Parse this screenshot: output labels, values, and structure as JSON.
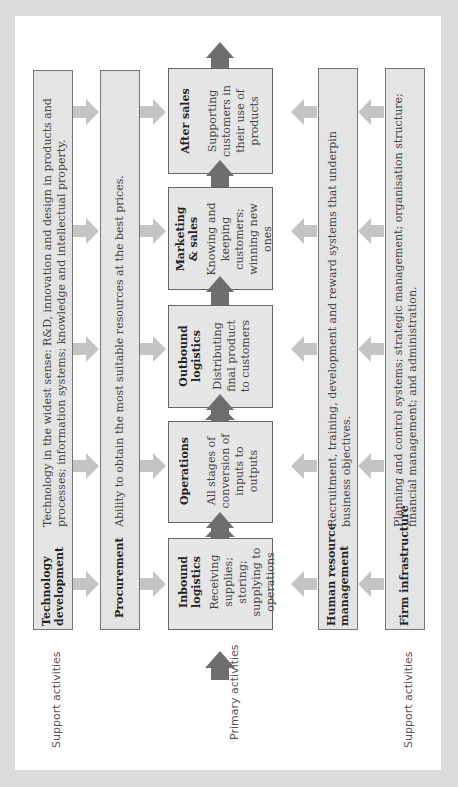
{
  "diagram": {
    "side_labels": {
      "support_top": "Support activities",
      "primary": "Primary activities",
      "support_bottom": "Support activities"
    },
    "support_activities": [
      {
        "name": "Technology development",
        "title_lines": [
          "Technology",
          "development"
        ],
        "description_lines": [
          "Technology in the widest sense: R&D, innovation and design in products and",
          "processes; information systems; knowledge and intellectual property."
        ]
      },
      {
        "name": "Procurement",
        "title_lines": [
          "Procurement"
        ],
        "description_lines": [
          "Ability to obtain the most suitable resources at the best prices."
        ]
      },
      {
        "name": "Human resource management",
        "title_lines": [
          "Human resource",
          "management"
        ],
        "description_lines": [
          "Recruitment, training, development and reward systems that underpin",
          "business objectives."
        ]
      },
      {
        "name": "Firm infrastructure",
        "title_lines": [
          "Firm infrastructure"
        ],
        "description_lines": [
          "Planning and control systems; strategic management; organisation structure;",
          "financial management; and administration."
        ]
      }
    ],
    "primary_activities": [
      {
        "name": "Inbound logistics",
        "title_lines": [
          "Inbound",
          "logistics"
        ],
        "description_lines": [
          "Receiving",
          "supplies;",
          "storing;",
          "supplying to",
          "operations"
        ]
      },
      {
        "name": "Operations",
        "title_lines": [
          "Operations"
        ],
        "description_lines": [
          "All stages of",
          "conversion of",
          "inputs to",
          "outputs"
        ]
      },
      {
        "name": "Outbound logistics",
        "title_lines": [
          "Outbound",
          "logistics"
        ],
        "description_lines": [
          "Distributing",
          "final product",
          "to customers"
        ]
      },
      {
        "name": "Marketing & sales",
        "title_lines": [
          "Marketing",
          "& sales"
        ],
        "description_lines": [
          "Knowing and",
          "keeping",
          "customers;",
          "winning new",
          "ones"
        ]
      },
      {
        "name": "After sales",
        "title_lines": [
          "After sales"
        ],
        "description_lines": [
          "Supporting",
          "customers in",
          "their use of",
          "products"
        ]
      }
    ],
    "colors": {
      "background": "#dcdcdc",
      "panel": "#ffffff",
      "box_fill": "#e5e5e5",
      "box_border": "#6a6a6a",
      "primary_arrow": "#6e6e6e",
      "support_arrow": "#c4c4c4"
    }
  }
}
